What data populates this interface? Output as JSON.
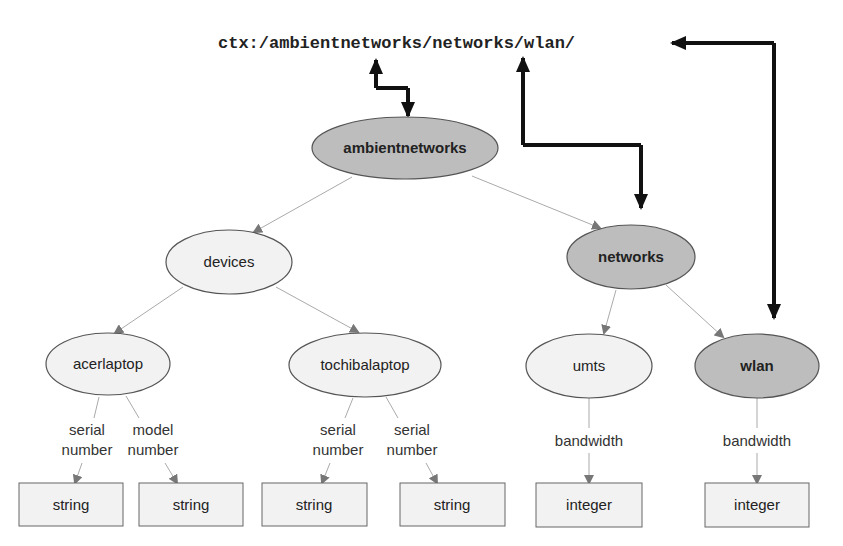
{
  "context_path": "ctx:/ambientnetworks/networks/wlan/",
  "colors": {
    "highlight_node_fill": "#bdbdbd",
    "normal_node_fill": "#f2f2f2",
    "node_stroke": "#555555",
    "edge": "#999999",
    "edge_arrow": "#777777",
    "context_arrow": "#111111",
    "box_fill": "#f2f2f2",
    "box_stroke": "#666666"
  },
  "nodes": {
    "ambientnetworks": {
      "label": "ambientnetworks",
      "highlighted": true
    },
    "devices": {
      "label": "devices",
      "highlighted": false
    },
    "networks": {
      "label": "networks",
      "highlighted": true
    },
    "acerlaptop": {
      "label": "acerlaptop",
      "highlighted": false
    },
    "tochibalaptop": {
      "label": "tochibalaptop",
      "highlighted": false
    },
    "umts": {
      "label": "umts",
      "highlighted": false
    },
    "wlan": {
      "label": "wlan",
      "highlighted": true
    }
  },
  "edge_labels": {
    "acer_serial": [
      "serial",
      "number"
    ],
    "acer_model": [
      "model",
      "number"
    ],
    "tochiba_serial1": [
      "serial",
      "number"
    ],
    "tochiba_serial2": [
      "serial",
      "number"
    ],
    "umts_bandwidth": "bandwidth",
    "wlan_bandwidth": "bandwidth"
  },
  "types": [
    "string",
    "string",
    "string",
    "string",
    "integer",
    "integer"
  ]
}
